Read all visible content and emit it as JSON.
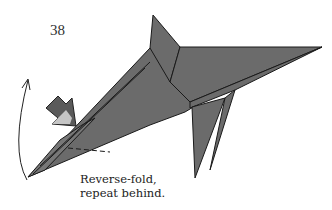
{
  "step": {
    "number": "38"
  },
  "caption": {
    "line1": "Reverse-fold,",
    "line2": "repeat behind."
  },
  "colors": {
    "paper": "#6b6b6b",
    "outline": "#1a1a1a",
    "arrow": "#555555"
  }
}
